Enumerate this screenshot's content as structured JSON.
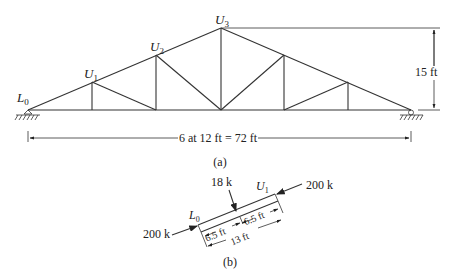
{
  "figure_a": {
    "caption": "(a)",
    "nodes": {
      "L0": {
        "label": "L",
        "sub": "0"
      },
      "U1": {
        "label": "U",
        "sub": "1"
      },
      "U2": {
        "label": "U",
        "sub": "2"
      },
      "U3": {
        "label": "U",
        "sub": "3"
      }
    },
    "height_dim": "15 ft",
    "span_dim": "6 at 12 ft = 72 ft"
  },
  "figure_b": {
    "caption": "(b)",
    "load_top": "18 k",
    "force_left": "200 k",
    "force_right": "200 k",
    "node_left": {
      "label": "L",
      "sub": "0"
    },
    "node_right": {
      "label": "U",
      "sub": "1"
    },
    "seg1": "6.5 ft",
    "seg2": "6.5 ft",
    "total": "13 ft"
  },
  "colors": {
    "line": "#333333",
    "text": "#222222",
    "background": "#ffffff"
  }
}
